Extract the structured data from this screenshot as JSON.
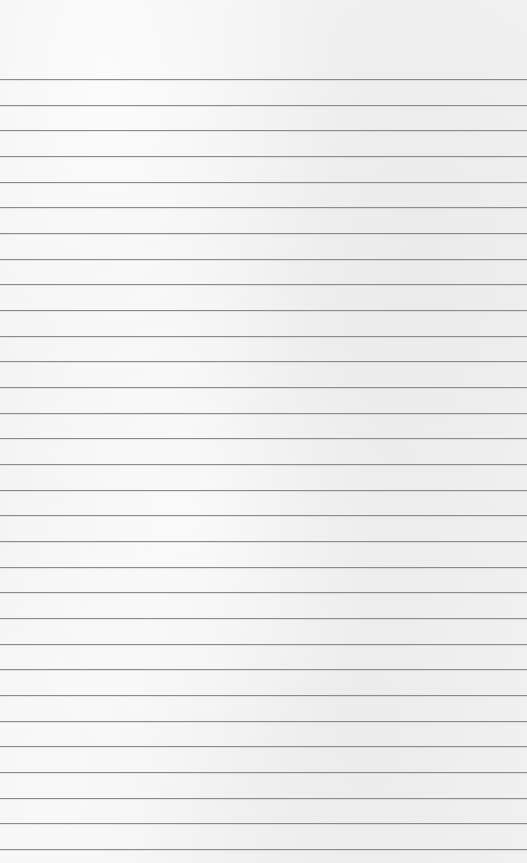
{
  "paper": {
    "background_color": "#f2f2f2",
    "line_color": "#8c8c8c",
    "first_line_y": 79,
    "line_spacing": 25.67,
    "line_count": 31
  }
}
